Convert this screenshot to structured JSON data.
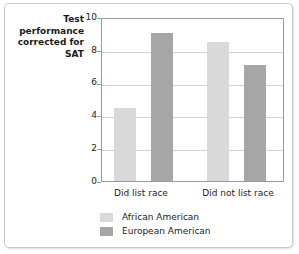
{
  "chart_data": {
    "type": "bar",
    "title": "",
    "subtitle": "",
    "xlabel": "",
    "ylabel": "Test performance corrected for SAT",
    "ylabel_lines": [
      "Test",
      "performance",
      "corrected for",
      "SAT"
    ],
    "categories": [
      "Did list race",
      "Did not list race"
    ],
    "series": [
      {
        "name": "African American",
        "color": "#d9d9d9",
        "values": [
          4.45,
          8.5
        ]
      },
      {
        "name": "European American",
        "color": "#a6a6a6",
        "values": [
          9.05,
          7.05
        ]
      }
    ],
    "ylim": [
      0,
      10
    ],
    "yticks": [
      0,
      2,
      4,
      6,
      8,
      10
    ],
    "ytick_labels": [
      "0",
      "2",
      "4",
      "6",
      "8",
      "10"
    ],
    "grid": "horizontal",
    "legend_position": "bottom-left"
  },
  "colors": {
    "african_american": "#d9d9d9",
    "european_american": "#a6a6a6",
    "gridline": "#d2d2d2",
    "axis": "#9a9a9a",
    "frame": "#c9c9c9",
    "text": "#1b1b1b",
    "background": "#ffffff"
  }
}
